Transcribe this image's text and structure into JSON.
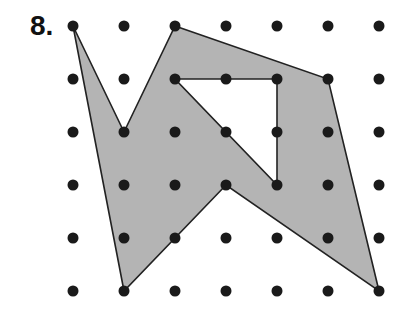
{
  "problem_number": "8.",
  "grid": {
    "cols": 7,
    "rows": 6,
    "x0": 73,
    "y0": 26,
    "dx": 51,
    "dy": 53
  },
  "shape": {
    "outer": [
      [
        0,
        0
      ],
      [
        1,
        2
      ],
      [
        2,
        0
      ],
      [
        5,
        1
      ],
      [
        6,
        5
      ],
      [
        3,
        3
      ],
      [
        1,
        5
      ]
    ],
    "hole": [
      [
        2,
        1
      ],
      [
        4,
        1
      ],
      [
        4,
        3
      ]
    ],
    "fill": "#b4b4b4",
    "stroke": "#222222"
  }
}
